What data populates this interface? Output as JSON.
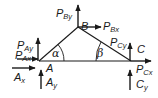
{
  "diagram": {
    "type": "free-body truss diagram",
    "nodes": {
      "A": {
        "label": "A"
      },
      "B": {
        "label": "B"
      },
      "C": {
        "label": "C"
      }
    },
    "angles": {
      "alpha": {
        "symbol": "α",
        "at": "A"
      },
      "beta": {
        "symbol": "β",
        "at": "C"
      }
    },
    "forces": [
      {
        "main": "P",
        "sub": "By",
        "node": "B",
        "direction": "up"
      },
      {
        "main": "P",
        "sub": "Bx",
        "node": "B",
        "direction": "right"
      },
      {
        "main": "P",
        "sub": "Ay",
        "node": "A",
        "direction": "up"
      },
      {
        "main": "P",
        "sub": "Ax",
        "node": "A",
        "direction": "right"
      },
      {
        "main": "A",
        "sub": "x",
        "node": "A",
        "direction": "right",
        "kind": "reaction"
      },
      {
        "main": "A",
        "sub": "y",
        "node": "A",
        "direction": "up",
        "kind": "reaction"
      },
      {
        "main": "P",
        "sub": "Cy",
        "node": "C",
        "direction": "up"
      },
      {
        "main": "P",
        "sub": "Cx",
        "node": "C",
        "direction": "right"
      },
      {
        "main": "C",
        "sub": "y",
        "node": "C",
        "direction": "up",
        "kind": "reaction"
      }
    ],
    "colors": {
      "line": "#1a1a1a",
      "background": "#ffffff"
    }
  }
}
